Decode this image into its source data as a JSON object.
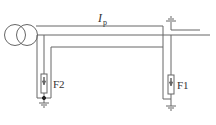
{
  "diagram": {
    "current_label": "I",
    "current_subscript": "p",
    "arrester_right_label": "F1",
    "arrester_left_label": "F2",
    "stroke_color": "#666666",
    "background": "#ffffff"
  }
}
